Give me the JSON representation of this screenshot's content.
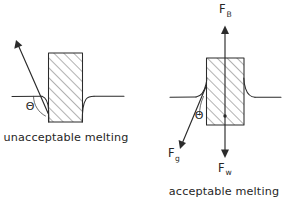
{
  "figure": {
    "title_visible": false,
    "background_color": "#ffffff",
    "ink_color": "#2b2b2b",
    "panels": [
      {
        "id": "left",
        "caption": "unacceptable melting",
        "angle_symbol": "Θ",
        "force_labels": [],
        "description_visible_text": "unacceptable melting"
      },
      {
        "id": "right",
        "caption": "acceptable melting",
        "angle_symbol": "Θ",
        "force_labels": [
          {
            "base": "F",
            "sub": "B",
            "direction": "up"
          },
          {
            "base": "F",
            "sub": "g",
            "direction": "down-left"
          },
          {
            "base": "F",
            "sub": "w",
            "direction": "down"
          }
        ],
        "description_visible_text": "acceptable melting"
      }
    ]
  },
  "labels": {
    "left_caption": "unacceptable melting",
    "right_caption": "acceptable melting",
    "theta_left": "Θ",
    "theta_right": "Θ",
    "force_buoyant_base": "F",
    "force_buoyant_sub": "B",
    "force_gravity_base": "F",
    "force_gravity_sub": "g",
    "force_weld_base": "F",
    "force_weld_sub": "w"
  }
}
